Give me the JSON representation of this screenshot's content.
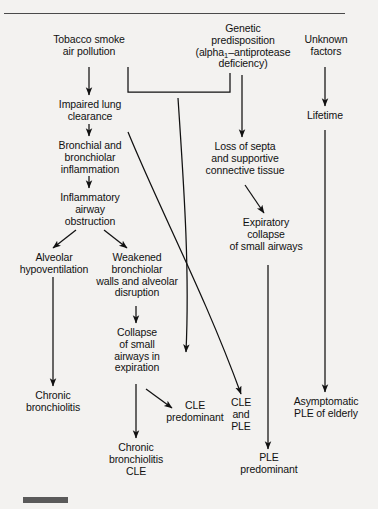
{
  "figure": {
    "background_color": "#f3f2f0",
    "ink_color": "#111111",
    "rule_color": "#4a4a4a",
    "bar_color": "#5a5a5a"
  },
  "nodes": {
    "tobacco_smoke": "Tobacco smoke\nair pollution",
    "genetic_predisposition_line1": "Genetic",
    "genetic_predisposition_line2": "predisposition",
    "genetic_predisposition_line3a": "(alpha",
    "genetic_predisposition_sub": "1",
    "genetic_predisposition_line3b": "–antiprotease",
    "genetic_predisposition_line4": "deficiency)",
    "unknown_factors": "Unknown\nfactors",
    "impaired_lung_clearance": "Impaired lung\nclearance",
    "bronchial_inflammation": "Bronchial and\nbronchiolar\ninflammation",
    "inflammatory_obstruction": "Inflammatory\nairway\nobstruction",
    "alveolar_hypoventilation": "Alveolar\nhypoventilation",
    "weakened_bronchiolar_walls": "Weakened\nbronchiolar\nwalls and alveolar\ndisruption",
    "collapse_small_airways": "Collapse\nof small\nairways in\nexpiration",
    "loss_of_septa": "Loss of septa\nand supportive\nconnective tissue",
    "expiratory_collapse": "Expiratory\ncollapse\nof small airways",
    "lifetime": "Lifetime",
    "chronic_bronchiolitis": "Chronic\nbronchiolitis",
    "cle_predominant": "CLE\npredominant",
    "chronic_bronchiolitis_cle": "Chronic\nbronchiolitis\nCLE",
    "cle_and_ple": "CLE\nand\nPLE",
    "ple_predominant": "PLE\npredominant",
    "asymptomatic_ple": "Asymptomatic\nPLE of elderly"
  }
}
